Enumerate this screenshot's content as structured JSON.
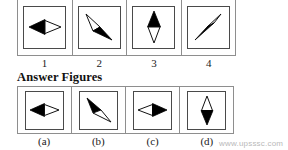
{
  "heading": {
    "answer_figures": "Answer Figures"
  },
  "problem_figures": {
    "labels": [
      "1",
      "2",
      "3",
      "4"
    ],
    "items": [
      {
        "name": "figure-1",
        "label": "1",
        "shape": "double-arrow-horizontal",
        "description": "Black left-pointing triangle joined to white outlined right-pointing triangle",
        "orientation": "horizontal",
        "filled_side": "left",
        "outline_side": "right"
      },
      {
        "name": "figure-2",
        "label": "2",
        "shape": "double-arrow-diagonal",
        "description": "White outlined triangle pointing upper-left joined to black triangle pointing lower-right",
        "orientation": "diagonal-nw-se",
        "filled_side": "lower-right",
        "outline_side": "upper-left"
      },
      {
        "name": "figure-3",
        "label": "3",
        "shape": "double-arrow-vertical",
        "description": "Black up-pointing triangle joined to white outlined down-pointing triangle",
        "orientation": "vertical",
        "filled_side": "top",
        "outline_side": "bottom"
      },
      {
        "name": "figure-4",
        "label": "4",
        "shape": "double-arrow-diagonal",
        "description": "Black triangle pointing lower-left joined to white outlined triangle pointing upper-right",
        "orientation": "diagonal-sw-ne",
        "filled_side": "lower-left",
        "outline_side": "upper-right"
      }
    ]
  },
  "answer_figures": {
    "labels": [
      "(a)",
      "(b)",
      "(c)",
      "(d)"
    ],
    "items": [
      {
        "name": "answer-a",
        "label": "(a)",
        "shape": "double-arrow-horizontal",
        "description": "Black left-pointing triangle joined to white outlined right-pointing triangle",
        "orientation": "horizontal",
        "filled_side": "left",
        "outline_side": "right"
      },
      {
        "name": "answer-b",
        "label": "(b)",
        "shape": "double-arrow-diagonal",
        "description": "Black triangle pointing upper-left joined to white outlined triangle pointing lower-right",
        "orientation": "diagonal-nw-se",
        "filled_side": "upper-left",
        "outline_side": "lower-right"
      },
      {
        "name": "answer-c",
        "label": "(c)",
        "shape": "double-arrow-horizontal",
        "description": "White outlined left-pointing triangle joined to black right-pointing triangle",
        "orientation": "horizontal",
        "filled_side": "right",
        "outline_side": "left"
      },
      {
        "name": "answer-d",
        "label": "(d)",
        "shape": "double-arrow-vertical",
        "description": "White outlined up-pointing triangle joined to black down-pointing triangle",
        "orientation": "vertical",
        "filled_side": "bottom",
        "outline_side": "top"
      }
    ]
  },
  "watermark": {
    "text": "www.upsssc.com"
  },
  "colors": {
    "ink": "#111111",
    "fill": "#000000",
    "frame": "#8e8e8e",
    "box_border": "#4a4a4a",
    "background": "#ffffff",
    "watermark": "#b9b9b9"
  }
}
